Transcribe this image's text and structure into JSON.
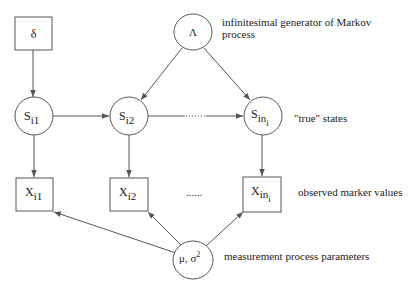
{
  "diagram": {
    "type": "graphical-model",
    "nodes": {
      "delta": {
        "label": "δ",
        "shape": "box"
      },
      "lambda": {
        "label": "Λ",
        "shape": "ellipse"
      },
      "s_i1": {
        "main": "S",
        "sub": "i1",
        "shape": "ellipse"
      },
      "s_i2": {
        "main": "S",
        "sub": "i2",
        "shape": "ellipse"
      },
      "s_ini": {
        "main": "S",
        "sub": "in",
        "subsub": "i",
        "shape": "ellipse"
      },
      "x_i1": {
        "main": "X",
        "sub": "i1",
        "shape": "box"
      },
      "x_i2": {
        "main": "X",
        "sub": "i2",
        "shape": "box"
      },
      "x_ini": {
        "main": "X",
        "sub": "in",
        "subsub": "i",
        "shape": "box"
      },
      "mu_sigma": {
        "label": "μ, σ",
        "sup": "2",
        "shape": "ellipse"
      }
    },
    "ellipsis": {
      "states": "......",
      "observations": "......"
    },
    "annotations": {
      "generator_line1": "infinitesimal generator of Markov",
      "generator_line2": "process",
      "true_states": "\"true\" states",
      "observed": "observed marker values",
      "measurement": "measurement process parameters"
    },
    "edges": [
      [
        "delta",
        "s_i1"
      ],
      [
        "lambda",
        "s_i2"
      ],
      [
        "lambda",
        "s_ini"
      ],
      [
        "s_i1",
        "s_i2"
      ],
      [
        "s_i2",
        "s_ini"
      ],
      [
        "s_i1",
        "x_i1"
      ],
      [
        "s_i2",
        "x_i2"
      ],
      [
        "s_ini",
        "x_ini"
      ],
      [
        "mu_sigma",
        "x_i1"
      ],
      [
        "mu_sigma",
        "x_i2"
      ],
      [
        "mu_sigma",
        "x_ini"
      ]
    ]
  }
}
